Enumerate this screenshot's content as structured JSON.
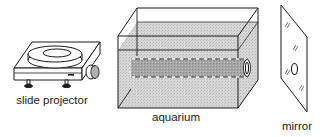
{
  "diagram": {
    "components": [
      {
        "id": "slide-projector",
        "label": "slide projector"
      },
      {
        "id": "aquarium",
        "label": "aquarium"
      },
      {
        "id": "mirror",
        "label": "mirror"
      }
    ],
    "colors": {
      "line": "#1a1a1a",
      "water": "#cfcfcf",
      "tube": "#9a9a9a",
      "background": "#ffffff"
    }
  }
}
